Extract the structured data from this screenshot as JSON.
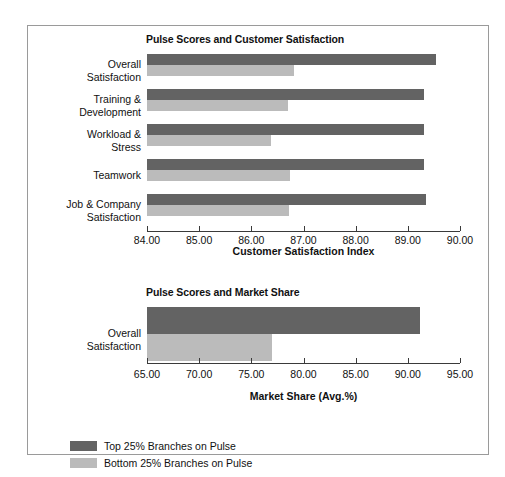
{
  "figure": {
    "background": "#ffffff",
    "border_color": "#9a9a9a",
    "series_colors": {
      "top": "#636363",
      "bottom": "#bbbbbb"
    }
  },
  "legend": {
    "items": [
      {
        "label": "Top 25% Branches on Pulse",
        "color": "#636363",
        "key": "top"
      },
      {
        "label": "Bottom 25% Branches on Pulse",
        "color": "#bbbbbb",
        "key": "bottom"
      }
    ]
  },
  "chart_data": [
    {
      "type": "bar",
      "orientation": "horizontal",
      "title": "Pulse Scores and Customer Satisfaction",
      "xlabel": "Customer Satisfaction Index",
      "ylabel": "",
      "xlim": [
        84.0,
        90.0
      ],
      "xticks": [
        84.0,
        85.0,
        86.0,
        87.0,
        88.0,
        89.0,
        90.0
      ],
      "xtick_labels": [
        "84.00",
        "85.00",
        "86.00",
        "87.00",
        "88.00",
        "89.00",
        "90.00"
      ],
      "grid": false,
      "legend_position": "below-figure",
      "categories": [
        "Overall\nSatisfaction",
        "Training &\nDevelopment",
        "Workload &\nStress",
        "Teamwork",
        "Job & Company\nSatisfaction"
      ],
      "category_lines": [
        [
          "Overall",
          "Satisfaction"
        ],
        [
          "Training &",
          "Development"
        ],
        [
          "Workload &",
          "Stress"
        ],
        [
          "Teamwork",
          ""
        ],
        [
          "Job & Company",
          "Satisfaction"
        ]
      ],
      "series": [
        {
          "name": "Top 25% Branches on Pulse",
          "key": "top",
          "values": [
            89.54,
            89.31,
            89.31,
            89.31,
            89.35
          ]
        },
        {
          "name": "Bottom 25% Branches on Pulse",
          "key": "bottom",
          "values": [
            86.82,
            86.7,
            86.38,
            86.75,
            86.72
          ]
        }
      ]
    },
    {
      "type": "bar",
      "orientation": "horizontal",
      "title": "Pulse Scores and Market Share",
      "xlabel": "Market Share (Avg.%)",
      "ylabel": "",
      "xlim": [
        65.0,
        95.0
      ],
      "xticks": [
        65.0,
        70.0,
        75.0,
        80.0,
        85.0,
        90.0,
        95.0
      ],
      "xtick_labels": [
        "65.00",
        "70.00",
        "75.00",
        "80.00",
        "85.00",
        "90.00",
        "95.00"
      ],
      "grid": false,
      "legend_position": "below-figure",
      "categories": [
        "Overall\nSatisfaction"
      ],
      "category_lines": [
        [
          "Overall",
          "Satisfaction"
        ]
      ],
      "series": [
        {
          "name": "Top 25% Branches on Pulse",
          "key": "top",
          "values": [
            91.2
          ]
        },
        {
          "name": "Bottom 25% Branches on Pulse",
          "key": "bottom",
          "values": [
            77.0
          ]
        }
      ]
    }
  ]
}
